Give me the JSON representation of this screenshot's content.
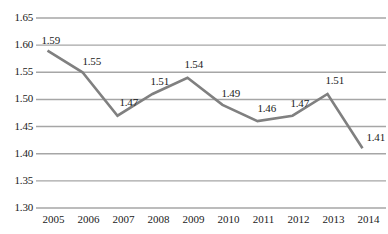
{
  "chart_data": {
    "type": "line",
    "title": "",
    "xlabel": "",
    "ylabel": "",
    "categories": [
      "2005",
      "2006",
      "2007",
      "2008",
      "2009",
      "2010",
      "2011",
      "2012",
      "2013",
      "2014"
    ],
    "values": [
      1.59,
      1.55,
      1.47,
      1.51,
      1.54,
      1.49,
      1.46,
      1.47,
      1.51,
      1.41
    ],
    "point_labels": [
      "1.59",
      "1.55",
      "1.47",
      "1.51",
      "1.54",
      "1.49",
      "1.46",
      "1.47",
      "1.51",
      "1.41"
    ],
    "ylim": [
      1.3,
      1.65
    ],
    "ytick_labels": [
      "1.65",
      "1.60",
      "1.55",
      "1.50",
      "1.45",
      "1.40",
      "1.35",
      "1.30"
    ],
    "ytick_values": [
      1.65,
      1.6,
      1.55,
      1.5,
      1.45,
      1.4,
      1.35,
      1.3
    ],
    "grid": true,
    "legend": false,
    "legend_position": "none",
    "series_color": "#808080",
    "grid_color": "#a6a6a6",
    "text_color": "#1a1a1a"
  }
}
